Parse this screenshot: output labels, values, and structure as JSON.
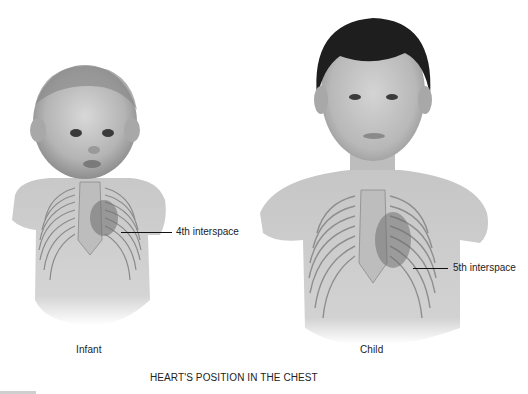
{
  "figure": {
    "title": "HEART'S POSITION IN THE CHEST",
    "panels": [
      {
        "name": "Infant",
        "caption": "Infant",
        "annotation": "4th interspace"
      },
      {
        "name": "Child",
        "caption": "Child",
        "annotation": "5th interspace"
      }
    ]
  },
  "colors": {
    "background": "#ffffff",
    "skin": "#cfcfcf",
    "skin_shadow": "#9a9a9a",
    "hair_child": "#1e1e1e",
    "hair_infant": "#8a8a8a",
    "text": "#222222"
  }
}
